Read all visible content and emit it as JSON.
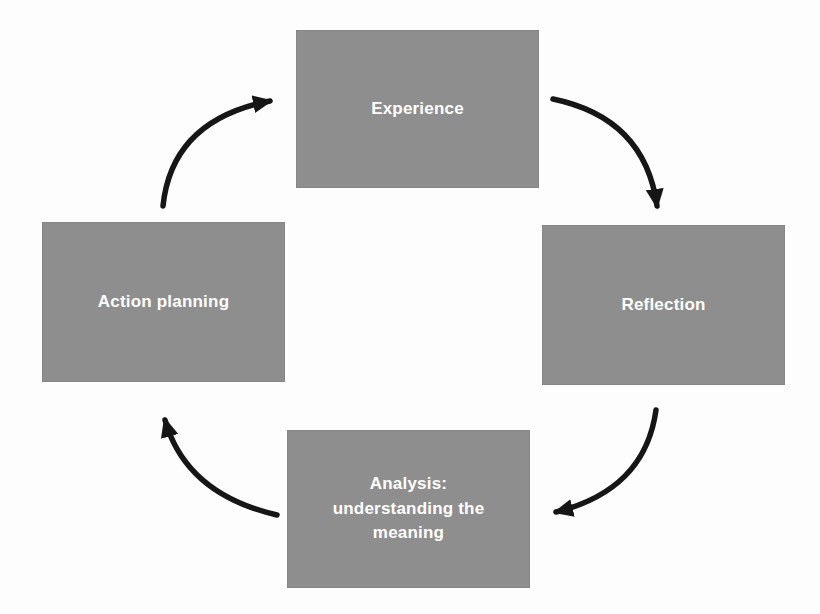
{
  "diagram": {
    "type": "cycle",
    "background_color": "#fdfdfd",
    "node_fill_color": "#8e8e8e",
    "node_border_color": "#868686",
    "node_text_color": "#ffffff",
    "arrow_color": "#161616",
    "nodes": [
      {
        "id": "experience",
        "label": "Experience",
        "position": "top"
      },
      {
        "id": "reflection",
        "label": "Reflection",
        "position": "right"
      },
      {
        "id": "analysis",
        "label": "Analysis:\nunderstanding the\nmeaning",
        "position": "bottom"
      },
      {
        "id": "action-planning",
        "label": "Action planning",
        "position": "left"
      }
    ],
    "arrows": [
      {
        "from": "experience",
        "to": "reflection",
        "direction": "clockwise"
      },
      {
        "from": "reflection",
        "to": "analysis",
        "direction": "clockwise"
      },
      {
        "from": "analysis",
        "to": "action-planning",
        "direction": "clockwise"
      },
      {
        "from": "action-planning",
        "to": "experience",
        "direction": "clockwise"
      }
    ]
  }
}
